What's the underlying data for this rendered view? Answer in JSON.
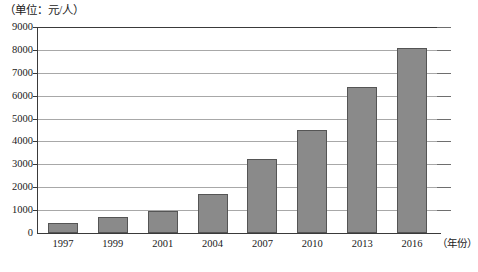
{
  "chart_data": {
    "type": "bar",
    "title": "",
    "unit_label": "（单位：元/人）",
    "xlabel": "（年份）",
    "ylabel": "",
    "categories": [
      "1997",
      "1999",
      "2001",
      "2004",
      "2007",
      "2010",
      "2013",
      "2016"
    ],
    "values": [
      450,
      700,
      950,
      1700,
      3250,
      4500,
      6400,
      8100
    ],
    "ylim": [
      0,
      9000
    ],
    "ytick_values": [
      0,
      1000,
      2000,
      3000,
      4000,
      5000,
      6000,
      7000,
      8000,
      9000
    ],
    "ytick_labels": [
      "0",
      "1000",
      "2000",
      "3000",
      "4000",
      "5000",
      "6000",
      "7000",
      "8000",
      "9000"
    ],
    "grid": true,
    "legend": "none",
    "bar_color": "#8a8a8a",
    "bar_edge_color": "#555555",
    "grid_color": "#a8a8a8",
    "axis_color": "#3a3a3a"
  }
}
